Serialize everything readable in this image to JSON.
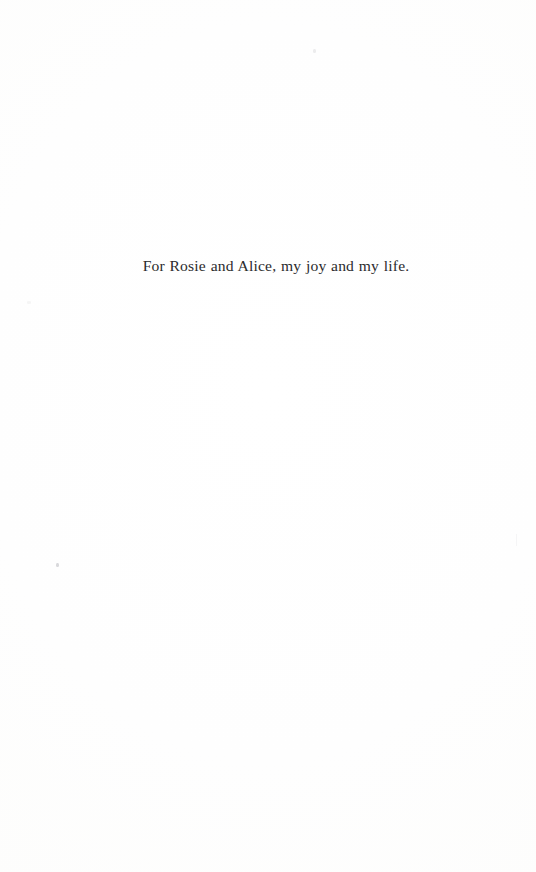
{
  "page": {
    "kind": "book-dedication-page",
    "background_color": "#fefefe",
    "width": 536,
    "height": 872
  },
  "dedication": {
    "text": "For Rosie and Alice, my joy and my life.",
    "color": "#2b2b2d",
    "alignment": "center"
  },
  "artifacts": {
    "speck_top": "",
    "speck_left_upper": "",
    "speck_left_lower": "",
    "speck_right_edge": ""
  }
}
